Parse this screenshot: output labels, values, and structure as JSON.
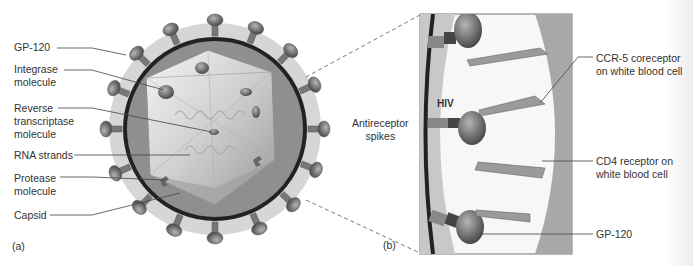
{
  "figure": {
    "panel_a": {
      "tag": "(a)",
      "labels": [
        {
          "id": "gp120",
          "text": "GP-120"
        },
        {
          "id": "integrase",
          "text": "Integrase\nmolecule"
        },
        {
          "id": "reverse-transcriptase",
          "text": "Reverse\ntranscriptase\nmolecule"
        },
        {
          "id": "rna",
          "text": "RNA strands"
        },
        {
          "id": "protease",
          "text": "Protease\nmolecule"
        },
        {
          "id": "capsid",
          "text": "Capsid"
        }
      ]
    },
    "panel_b": {
      "tag": "(b)",
      "antireceptor_label": "Antireceptor\nspikes",
      "hiv_label": "HIV",
      "labels": [
        {
          "id": "ccr5",
          "text": "CCR-5 coreceptor\non white blood cell"
        },
        {
          "id": "cd4",
          "text": "CD4 receptor on\nwhite blood cell"
        },
        {
          "id": "gp120-b",
          "text": "GP-120"
        }
      ]
    },
    "colors": {
      "outer_halo": "#cfcfcf",
      "envelope": "#2a2a2a",
      "capsid_fill": "#8f8f8f",
      "spike": "#7a7a7a",
      "cell_membrane": "#a8a8a8",
      "leader_line": "#444444"
    }
  }
}
